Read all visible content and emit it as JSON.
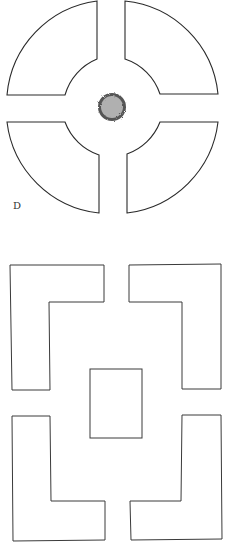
{
  "figure_top": {
    "label": "D",
    "description": "Circular garden plan with four quarter-ring beds and a central round shrub",
    "center_feature": "shrub",
    "colors": {
      "stroke": "#2a2a2a",
      "shrub_fill": "#a8a8a8",
      "shrub_edge": "#555555"
    }
  },
  "figure_bottom": {
    "description": "Square plan with four L-shaped beds around a central rectangular bed",
    "colors": {
      "stroke": "#3a3a3a"
    }
  }
}
